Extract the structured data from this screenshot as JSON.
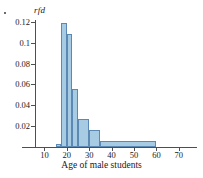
{
  "figure": {
    "bullet": "•"
  },
  "chart_data": {
    "type": "bar",
    "title": "",
    "subtitle": "",
    "xlabel": "Age of male students",
    "ylabel": "rfd",
    "xlim": [
      0,
      78
    ],
    "ylim": [
      0,
      0.125
    ],
    "grid": false,
    "legend": "none",
    "xticks": [
      10,
      20,
      30,
      40,
      50,
      60,
      70
    ],
    "xtick_labels": [
      "10",
      "20",
      "30",
      "40",
      "50",
      "60",
      "70"
    ],
    "yticks": [
      0.02,
      0.04,
      0.06,
      0.08,
      0.1,
      0.12
    ],
    "ytick_labels": [
      "0.02",
      "0.04",
      "0.06",
      "0.08",
      "0.1",
      "0.12"
    ],
    "bins": [
      {
        "x0": 15,
        "x1": 17.5,
        "value": 0.003
      },
      {
        "x0": 17.5,
        "x1": 20,
        "value": 0.119
      },
      {
        "x0": 20,
        "x1": 22.5,
        "value": 0.108
      },
      {
        "x0": 22.5,
        "x1": 25,
        "value": 0.056
      },
      {
        "x0": 25,
        "x1": 30,
        "value": 0.027
      },
      {
        "x0": 30,
        "x1": 35,
        "value": 0.016
      },
      {
        "x0": 35,
        "x1": 60,
        "value": 0.006
      }
    ],
    "bar_fill": "#a8cbe4",
    "bar_edge": "#5b89b4",
    "axis_color": "#4f4f4f"
  }
}
